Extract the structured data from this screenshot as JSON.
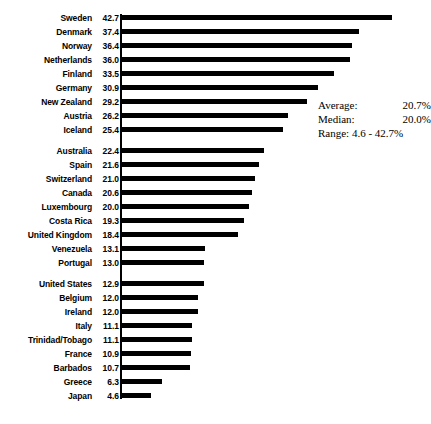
{
  "chart_data": {
    "type": "bar",
    "orientation": "horizontal",
    "title": "",
    "subtitle": "",
    "xlabel": "",
    "ylabel": "",
    "grid": false,
    "axis_visible": true,
    "xlim": [
      0,
      42.7
    ],
    "value_suffix": "%",
    "categories": [
      "Sweden",
      "Denmark",
      "Norway",
      "Netherlands",
      "Finland",
      "Germany",
      "New Zealand",
      "Austria",
      "Iceland",
      "Australia",
      "Spain",
      "Switzerland",
      "Canada",
      "Luxembourg",
      "Costa Rica",
      "United Kingdom",
      "Venezuela",
      "Portugal",
      "United States",
      "Belgium",
      "Ireland",
      "Italy",
      "Trinidad/Tobago",
      "France",
      "Barbados",
      "Greece",
      "Japan"
    ],
    "values": [
      42.7,
      37.4,
      36.4,
      36.0,
      33.5,
      30.9,
      29.2,
      26.2,
      25.4,
      22.4,
      21.6,
      21.0,
      20.6,
      20.0,
      19.3,
      18.4,
      13.1,
      13.0,
      12.9,
      12.0,
      12.0,
      11.1,
      11.1,
      10.9,
      10.7,
      6.3,
      4.6
    ],
    "value_labels": [
      "42.7",
      "37.4",
      "36.4",
      "36.0",
      "33.5",
      "30.9",
      "29.2",
      "26.2",
      "25.4",
      "22.4",
      "21.6",
      "21.0",
      "20.6",
      "20.0",
      "19.3",
      "18.4",
      "13.1",
      "13.0",
      "12.9",
      "12.0",
      "12.0",
      "11.1",
      "11.1",
      "10.9",
      "10.7",
      "6.3",
      "4.6"
    ],
    "groups": [
      {
        "start_index": 0,
        "count": 9
      },
      {
        "start_index": 9,
        "count": 9
      },
      {
        "start_index": 18,
        "count": 9
      }
    ],
    "bar_color": "#000000",
    "background_color": "#ffffff"
  },
  "stats": {
    "average_label": "Average:",
    "average_value": "20.7%",
    "median_label": "Median:",
    "median_value": "20.0%",
    "range_label": "Range:",
    "range_value": "4.6 - 42.7%"
  }
}
